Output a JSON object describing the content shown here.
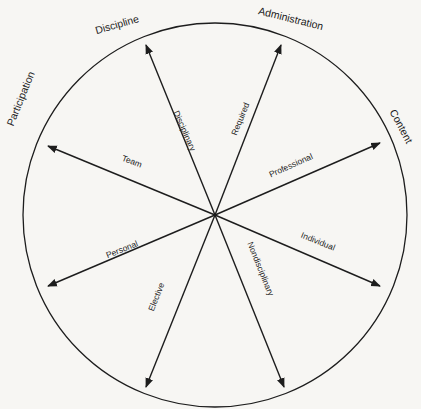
{
  "diagram": {
    "center": [
      215,
      215
    ],
    "radius": 192,
    "outer_labels": [
      {
        "text": "Discipline",
        "x": 118,
        "y": 28,
        "rotate": -16,
        "size": 10.5
      },
      {
        "text": "Administration",
        "x": 290,
        "y": 22,
        "rotate": 14,
        "size": 10.5
      },
      {
        "text": "Content",
        "x": 398,
        "y": 128,
        "rotate": 62,
        "size": 10.5
      },
      {
        "text": "Participation",
        "x": 24,
        "y": 100,
        "rotate": -68,
        "size": 10.5
      }
    ],
    "arrows": [
      {
        "name": "disciplinary",
        "end": [
          146,
          45
        ],
        "label": "Disciplinary",
        "lx": 182,
        "ly": 132,
        "lrot": 66,
        "size": 8.5
      },
      {
        "name": "required",
        "end": [
          281,
          45
        ],
        "label": "Required",
        "lx": 243,
        "ly": 120,
        "lrot": -68,
        "size": 8.5
      },
      {
        "name": "professional",
        "end": [
          380,
          143
        ],
        "label": "Professional",
        "lx": 292,
        "ly": 168,
        "lrot": -24,
        "size": 8.5
      },
      {
        "name": "team",
        "end": [
          48,
          146
        ],
        "label": "Team",
        "lx": 131,
        "ly": 164,
        "lrot": 20,
        "size": 8.5
      },
      {
        "name": "personal",
        "end": [
          48,
          286
        ],
        "label": "Personal",
        "lx": 123,
        "ly": 252,
        "lrot": -22,
        "size": 8.5
      },
      {
        "name": "individual",
        "end": [
          380,
          286
        ],
        "label": "Individual",
        "lx": 317,
        "ly": 244,
        "lrot": 22,
        "size": 8.5
      },
      {
        "name": "elective",
        "end": [
          146,
          387
        ],
        "label": "Elective",
        "lx": 159,
        "ly": 298,
        "lrot": -68,
        "size": 8.5
      },
      {
        "name": "nondisciplinary",
        "end": [
          284,
          387
        ],
        "label": "Nondisciplinary",
        "lx": 258,
        "ly": 270,
        "lrot": 68,
        "size": 8.5
      }
    ]
  }
}
